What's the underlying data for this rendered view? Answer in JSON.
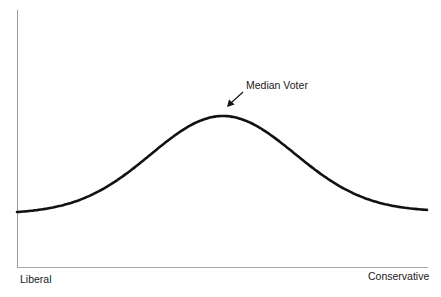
{
  "chart_data": {
    "type": "line",
    "title": "",
    "subtitle": "",
    "xlabel": "",
    "ylabel": "",
    "x_tick_labels": {
      "left": "Liberal",
      "right": "Conservative"
    },
    "series": [
      {
        "name": "Voter distribution",
        "shape": "bell-curve (normal distribution)",
        "x": [
          0,
          0.1,
          0.2,
          0.3,
          0.4,
          0.5,
          0.6,
          0.7,
          0.8,
          0.9,
          1.0
        ],
        "values": [
          0.1,
          0.15,
          0.26,
          0.45,
          0.68,
          0.78,
          0.68,
          0.45,
          0.27,
          0.16,
          0.11
        ]
      }
    ],
    "annotations": [
      {
        "text": "Median Voter",
        "points_to": "curve peak (median of distribution)",
        "arrow": true
      }
    ],
    "axis_ranges": {
      "x": [
        0,
        1
      ],
      "y": [
        0,
        1
      ]
    },
    "grid": false,
    "legend": "none",
    "ticks": "none"
  },
  "labels": {
    "left": "Liberal",
    "right": "Conservative",
    "annotation": "Median Voter"
  },
  "colors": {
    "curve": "#111111",
    "axis": "#9a9a9a",
    "text": "#1a1a1a",
    "background": "#ffffff"
  }
}
